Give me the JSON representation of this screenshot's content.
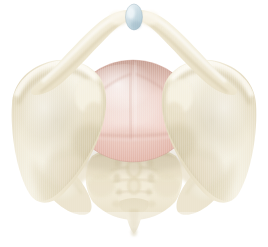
{
  "figure": {
    "title": "Fetal head engaged in the female pelvic inlet",
    "view": "superior (inlet) view",
    "background_color": "#ffffff",
    "width": 268,
    "height": 247
  },
  "palette": {
    "bone_light": "#f7f3e6",
    "bone_mid": "#ece4cd",
    "bone_shadow": "#d9cfb0",
    "bone_deep_shadow": "#c8bc98",
    "bone_outline": "#cfc4a4",
    "cartilage_light": "#e2ecf0",
    "cartilage_mid": "#c6d8e0",
    "cartilage_shadow": "#a9c2ce",
    "head_light": "#fbeeea",
    "head_mid": "#f2cfc6",
    "head_shadow": "#dcab9d",
    "head_rim": "#b98d7e",
    "suture_line": "#c99a8c"
  },
  "structures": [
    {
      "id": "pubic-symphysis",
      "label": "Pubic symphysis",
      "color": "#c6d8e0"
    },
    {
      "id": "superior-pubic-ramus-left",
      "label": "Left superior pubic ramus",
      "color": "#f2ecda"
    },
    {
      "id": "superior-pubic-ramus-right",
      "label": "Right superior pubic ramus",
      "color": "#f2ecda"
    },
    {
      "id": "ilium-left",
      "label": "Left ilium (iliac wing)",
      "color": "#ece4cd"
    },
    {
      "id": "ilium-right",
      "label": "Right ilium (iliac wing)",
      "color": "#ece4cd"
    },
    {
      "id": "acetabulum-left",
      "label": "Left acetabular region",
      "color": "#ddd2b4"
    },
    {
      "id": "acetabulum-right",
      "label": "Right acetabular region",
      "color": "#ddd2b4"
    },
    {
      "id": "ischium-left",
      "label": "Left ischium",
      "color": "#e8e0c8"
    },
    {
      "id": "ischium-right",
      "label": "Right ischium",
      "color": "#e8e0c8"
    },
    {
      "id": "sacrum",
      "label": "Sacrum",
      "color": "#e6ddc5"
    },
    {
      "id": "coccyx",
      "label": "Coccyx",
      "color": "#e3d9bf"
    },
    {
      "id": "fetal-head",
      "label": "Fetal head (cranial vault)",
      "color": "#f2cfc6"
    },
    {
      "id": "sagittal-suture",
      "label": "Sagittal suture",
      "color": "#c99a8c"
    },
    {
      "id": "coronal-suture-left",
      "label": "Left coronal suture",
      "color": "#c99a8c"
    },
    {
      "id": "coronal-suture-right",
      "label": "Right coronal suture",
      "color": "#c99a8c"
    },
    {
      "id": "lambdoid-suture",
      "label": "Lambdoid suture",
      "color": "#c99a8c"
    }
  ]
}
